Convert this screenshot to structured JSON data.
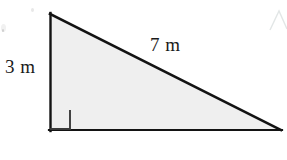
{
  "figure": {
    "name": "right-triangle-diagram",
    "shape": "right triangle",
    "background_color": "#ffffff",
    "fill_color": "#efefef",
    "stroke_color": "#1a1a1a",
    "vertices": {
      "apex": [
        50,
        14
      ],
      "bottom_left": [
        50,
        130
      ],
      "bottom_right": [
        281,
        130
      ]
    },
    "right_angle_marker": {
      "name": "right-angle-marker",
      "corner": "bottom-left",
      "size": 19
    }
  },
  "labels": {
    "vertical_leg": "3 m",
    "hypotenuse": "7 m"
  },
  "artifacts": {
    "corner_mark": "faint-partial-triangle-top-right",
    "speck_note": "faint scan specks top-left"
  }
}
